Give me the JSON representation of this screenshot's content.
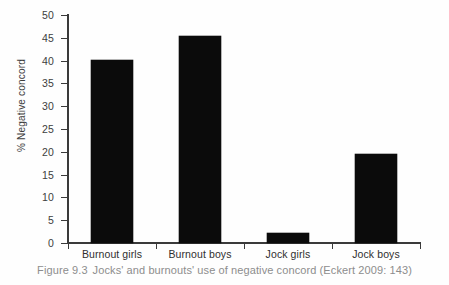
{
  "chart_data": {
    "type": "bar",
    "title": "",
    "categories": [
      "Burnout girls",
      "Burnout boys",
      "Jock girls",
      "Jock boys"
    ],
    "values": [
      40.1,
      45.3,
      2.2,
      19.5
    ],
    "xlabel": "",
    "ylabel": "% Negative concord",
    "ylim": [
      0,
      50
    ],
    "yticks": [
      0,
      5,
      10,
      15,
      20,
      25,
      30,
      35,
      40,
      45,
      50
    ],
    "ytick_labels": [
      "0",
      "5",
      "10",
      "15",
      "20",
      "25",
      "30",
      "35",
      "40",
      "45",
      "50"
    ],
    "grid": false,
    "legend": false,
    "legend_position": "none",
    "bar_color": "#0b0b0b",
    "axis_color": "#3a3a3a",
    "text_color": "#3d3d3d"
  },
  "figure": {
    "caption_number": "Figure 9.3",
    "caption_text": "Jocks' and burnouts' use of negative concord (Eckert 2009: 143)",
    "caption_color": "#8d8d8d"
  }
}
